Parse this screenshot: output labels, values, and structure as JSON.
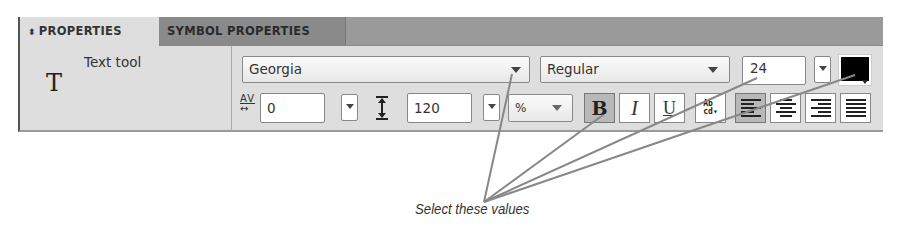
{
  "tabs": [
    {
      "label": "PROPERTIES",
      "icon": "up-down-arrows-icon",
      "active": true
    },
    {
      "label": "SYMBOL PROPERTIES",
      "active": false
    }
  ],
  "tool": {
    "icon": "text-tool-icon",
    "glyph": "T",
    "label": "Text tool"
  },
  "font_family": {
    "value": "Georgia"
  },
  "font_style": {
    "value": "Regular"
  },
  "font_size": {
    "value": "24"
  },
  "fill_color": {
    "value": "#000000"
  },
  "tracking": {
    "icon": "tracking-icon",
    "icon_text": "AV",
    "value": "0"
  },
  "leading": {
    "icon": "leading-icon",
    "value": "120",
    "unit": "%"
  },
  "style_buttons": [
    {
      "name": "bold",
      "label": "B",
      "pressed": true
    },
    {
      "name": "italic",
      "label": "I",
      "pressed": false
    },
    {
      "name": "underline",
      "label": "U",
      "pressed": false
    }
  ],
  "text_wrap": {
    "icon": "text-wrap-icon",
    "top": "Ab",
    "bottom": "cd"
  },
  "alignment": [
    {
      "name": "left",
      "pressed": true
    },
    {
      "name": "center",
      "pressed": false
    },
    {
      "name": "right",
      "pressed": false
    },
    {
      "name": "justify",
      "pressed": false
    }
  ],
  "annotation": {
    "caption": "Select these values",
    "line_color": "#888888"
  }
}
